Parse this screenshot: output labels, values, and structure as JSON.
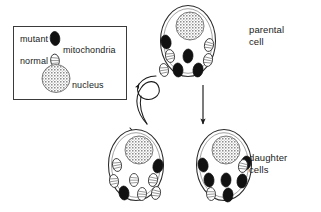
{
  "figure": {
    "width": 321,
    "height": 212,
    "background": "#ffffff",
    "ink_color": "#1a1a1a"
  },
  "legend": {
    "box": {
      "x": 13,
      "y": 26,
      "width": 114,
      "height": 74
    },
    "items": [
      {
        "key": "mutant",
        "label": "mutant",
        "swatch": "mutant-mitochondrion-icon",
        "fill": "#111111"
      },
      {
        "key": "normal",
        "label": "normal",
        "swatch": "normal-mitochondrion-icon",
        "fill": "#ffffff"
      },
      {
        "key": "mito",
        "label": "mitochondria",
        "swatch": null,
        "fill": null
      },
      {
        "key": "nucleus",
        "label": "nucleus",
        "swatch": "nucleus-icon",
        "fill": "#b8b8b8"
      }
    ]
  },
  "labels": {
    "parental": "parental\ncell",
    "daughter": "daughter\ncells"
  },
  "cells": [
    {
      "id": "parental-cell",
      "role": "parental",
      "center": {
        "x": 188,
        "y": 41
      },
      "rx": 27,
      "ry": 35,
      "nucleus": {
        "cx": 190,
        "cy": 26,
        "r": 14
      },
      "mutant_count": 4,
      "normal_count": 4,
      "mitochondria": [
        {
          "x": 166,
          "y": 42,
          "rx": 5.0,
          "ry": 7.0,
          "rot": -12,
          "type": "mutant"
        },
        {
          "x": 188,
          "y": 56,
          "rx": 5.0,
          "ry": 7.0,
          "rot": 4,
          "type": "mutant"
        },
        {
          "x": 178,
          "y": 70,
          "rx": 5.0,
          "ry": 7.0,
          "rot": -4,
          "type": "mutant"
        },
        {
          "x": 198,
          "y": 70,
          "rx": 5.0,
          "ry": 7.0,
          "rot": 8,
          "type": "mutant"
        },
        {
          "x": 170,
          "y": 56,
          "rx": 4.5,
          "ry": 6.5,
          "rot": -10,
          "type": "normal"
        },
        {
          "x": 209,
          "y": 45,
          "rx": 4.5,
          "ry": 6.5,
          "rot": 12,
          "type": "normal"
        },
        {
          "x": 208,
          "y": 60,
          "rx": 4.5,
          "ry": 6.5,
          "rot": 10,
          "type": "normal"
        },
        {
          "x": 164,
          "y": 70,
          "rx": 4.5,
          "ry": 6.5,
          "rot": -8,
          "type": "normal"
        }
      ]
    },
    {
      "id": "daughter-cell-left",
      "role": "daughter",
      "center": {
        "x": 136,
        "y": 165
      },
      "rx": 27,
      "ry": 35,
      "nucleus": {
        "cx": 139,
        "cy": 150,
        "r": 14
      },
      "mutant_count": 2,
      "normal_count": 6,
      "mitochondria": [
        {
          "x": 158,
          "y": 166,
          "rx": 5.0,
          "ry": 7.0,
          "rot": 12,
          "type": "mutant"
        },
        {
          "x": 124,
          "y": 193,
          "rx": 5.0,
          "ry": 7.0,
          "rot": -6,
          "type": "mutant"
        },
        {
          "x": 117,
          "y": 165,
          "rx": 4.5,
          "ry": 6.5,
          "rot": -10,
          "type": "normal"
        },
        {
          "x": 114,
          "y": 181,
          "rx": 4.5,
          "ry": 6.5,
          "rot": -8,
          "type": "normal"
        },
        {
          "x": 134,
          "y": 180,
          "rx": 4.5,
          "ry": 6.5,
          "rot": 0,
          "type": "normal"
        },
        {
          "x": 153,
          "y": 180,
          "rx": 4.5,
          "ry": 6.5,
          "rot": 8,
          "type": "normal"
        },
        {
          "x": 142,
          "y": 194,
          "rx": 4.5,
          "ry": 6.5,
          "rot": 4,
          "type": "normal"
        },
        {
          "x": 156,
          "y": 193,
          "rx": 4.5,
          "ry": 6.5,
          "rot": 10,
          "type": "normal"
        }
      ]
    },
    {
      "id": "daughter-cell-right",
      "role": "daughter",
      "center": {
        "x": 224,
        "y": 165
      },
      "rx": 27,
      "ry": 35,
      "nucleus": {
        "cx": 226,
        "cy": 150,
        "r": 14
      },
      "mutant_count": 6,
      "normal_count": 2,
      "mitochondria": [
        {
          "x": 203,
          "y": 165,
          "rx": 5.0,
          "ry": 7.0,
          "rot": -12,
          "type": "mutant"
        },
        {
          "x": 246,
          "y": 163,
          "rx": 5.0,
          "ry": 7.0,
          "rot": 12,
          "type": "mutant"
        },
        {
          "x": 209,
          "y": 180,
          "rx": 5.0,
          "ry": 7.0,
          "rot": -6,
          "type": "mutant"
        },
        {
          "x": 226,
          "y": 180,
          "rx": 5.0,
          "ry": 7.0,
          "rot": 2,
          "type": "mutant"
        },
        {
          "x": 242,
          "y": 181,
          "rx": 5.0,
          "ry": 7.0,
          "rot": 8,
          "type": "mutant"
        },
        {
          "x": 228,
          "y": 195,
          "rx": 5.0,
          "ry": 7.0,
          "rot": 4,
          "type": "mutant"
        },
        {
          "x": 243,
          "y": 166,
          "rx": 4.5,
          "ry": 6.5,
          "rot": 10,
          "type": "normal"
        },
        {
          "x": 211,
          "y": 194,
          "rx": 4.5,
          "ry": 6.5,
          "rot": -4,
          "type": "normal"
        }
      ]
    }
  ],
  "arrows": [
    {
      "id": "arrow-curved-left",
      "style": "curved-looping",
      "from": "parental-cell",
      "to": "daughter-cell-left"
    },
    {
      "id": "arrow-straight-down",
      "style": "straight-down",
      "from": "parental-cell",
      "to": "daughter-cell-right"
    }
  ]
}
